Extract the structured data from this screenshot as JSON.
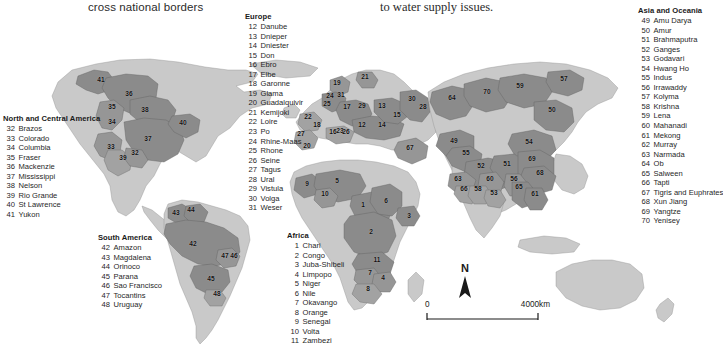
{
  "headings": {
    "left_caption": "cross national borders",
    "right_caption": "to water supply issues."
  },
  "colors": {
    "background": "#ffffff",
    "ocean": "#ffffff",
    "land": "#c9c9c9",
    "basin_dark": "#8b8b8b",
    "basin_mid": "#a4a4a4",
    "coast_line": "#6e6e6e",
    "text": "#1a1a1a"
  },
  "scale": {
    "zero_label": "0",
    "max_label": "4000km",
    "north_label": "N"
  },
  "legends": [
    {
      "id": "europe",
      "title": "Europe",
      "items": [
        {
          "num": "12",
          "name": "Danube"
        },
        {
          "num": "13",
          "name": "Dnieper"
        },
        {
          "num": "14",
          "name": "Dniester"
        },
        {
          "num": "15",
          "name": "Don"
        },
        {
          "num": "16",
          "name": "Ebro"
        },
        {
          "num": "17",
          "name": "Elbe"
        },
        {
          "num": "18",
          "name": "Garonne"
        },
        {
          "num": "19",
          "name": "Glama"
        },
        {
          "num": "20",
          "name": "Guadalquivir"
        },
        {
          "num": "21",
          "name": "Kemijoki"
        },
        {
          "num": "22",
          "name": "Loire"
        },
        {
          "num": "23",
          "name": "Po"
        },
        {
          "num": "24",
          "name": "Rhine-Maas"
        },
        {
          "num": "25",
          "name": "Rhone"
        },
        {
          "num": "26",
          "name": "Seine"
        },
        {
          "num": "27",
          "name": "Tagus"
        },
        {
          "num": "28",
          "name": "Ural"
        },
        {
          "num": "29",
          "name": "Vistula"
        },
        {
          "num": "30",
          "name": "Volga"
        },
        {
          "num": "31",
          "name": "Weser"
        }
      ]
    },
    {
      "id": "asia",
      "title": "Asia and Oceania",
      "items": [
        {
          "num": "49",
          "name": "Amu Darya"
        },
        {
          "num": "50",
          "name": "Amur"
        },
        {
          "num": "51",
          "name": "Brahmaputra"
        },
        {
          "num": "52",
          "name": "Ganges"
        },
        {
          "num": "53",
          "name": "Godavari"
        },
        {
          "num": "54",
          "name": "Hwang Ho"
        },
        {
          "num": "55",
          "name": "Indus"
        },
        {
          "num": "56",
          "name": "Irrawaddy"
        },
        {
          "num": "57",
          "name": "Kolyma"
        },
        {
          "num": "58",
          "name": "Krishna"
        },
        {
          "num": "59",
          "name": "Lena"
        },
        {
          "num": "60",
          "name": "Mahanadi"
        },
        {
          "num": "61",
          "name": "Mekong"
        },
        {
          "num": "62",
          "name": "Murray"
        },
        {
          "num": "63",
          "name": "Narmada"
        },
        {
          "num": "64",
          "name": "Ob"
        },
        {
          "num": "65",
          "name": "Salween"
        },
        {
          "num": "66",
          "name": "Tapti"
        },
        {
          "num": "67",
          "name": "Tigris and Euphrates"
        },
        {
          "num": "68",
          "name": "Xun Jiang"
        },
        {
          "num": "69",
          "name": "Yangtze"
        },
        {
          "num": "70",
          "name": "Yenisey"
        }
      ]
    },
    {
      "id": "namerica",
      "title": "North and Central America",
      "items": [
        {
          "num": "32",
          "name": "Brazos"
        },
        {
          "num": "33",
          "name": "Colorado"
        },
        {
          "num": "34",
          "name": "Columbia"
        },
        {
          "num": "35",
          "name": "Fraser"
        },
        {
          "num": "36",
          "name": "Mackenzie"
        },
        {
          "num": "37",
          "name": "Mississippi"
        },
        {
          "num": "38",
          "name": "Nelson"
        },
        {
          "num": "39",
          "name": "Rio Grande"
        },
        {
          "num": "40",
          "name": "St Lawrence"
        },
        {
          "num": "41",
          "name": "Yukon"
        }
      ]
    },
    {
      "id": "samerica",
      "title": "South America",
      "items": [
        {
          "num": "42",
          "name": "Amazon"
        },
        {
          "num": "43",
          "name": "Magdalena"
        },
        {
          "num": "44",
          "name": "Orinoco"
        },
        {
          "num": "45",
          "name": "Parana"
        },
        {
          "num": "46",
          "name": "Sao Francisco"
        },
        {
          "num": "47",
          "name": "Tocantins"
        },
        {
          "num": "48",
          "name": "Uruguay"
        }
      ]
    },
    {
      "id": "africa",
      "title": "Africa",
      "items": [
        {
          "num": "1",
          "name": "Chari"
        },
        {
          "num": "2",
          "name": "Congo"
        },
        {
          "num": "3",
          "name": "Juba-Shibeli"
        },
        {
          "num": "4",
          "name": "Limpopo"
        },
        {
          "num": "5",
          "name": "Niger"
        },
        {
          "num": "6",
          "name": "Nile"
        },
        {
          "num": "7",
          "name": "Okavango"
        },
        {
          "num": "8",
          "name": "Orange"
        },
        {
          "num": "9",
          "name": "Senegal"
        },
        {
          "num": "10",
          "name": "Volta"
        },
        {
          "num": "11",
          "name": "Zambezi"
        }
      ]
    }
  ],
  "map_labels": [
    {
      "num": "41",
      "x": 101,
      "y": 79
    },
    {
      "num": "36",
      "x": 129,
      "y": 93
    },
    {
      "num": "35",
      "x": 112,
      "y": 106
    },
    {
      "num": "38",
      "x": 145,
      "y": 109
    },
    {
      "num": "34",
      "x": 112,
      "y": 121
    },
    {
      "num": "40",
      "x": 183,
      "y": 122
    },
    {
      "num": "37",
      "x": 148,
      "y": 138
    },
    {
      "num": "33",
      "x": 111,
      "y": 146
    },
    {
      "num": "32",
      "x": 135,
      "y": 152
    },
    {
      "num": "39",
      "x": 123,
      "y": 157
    },
    {
      "num": "43",
      "x": 176,
      "y": 212
    },
    {
      "num": "44",
      "x": 191,
      "y": 209
    },
    {
      "num": "42",
      "x": 193,
      "y": 243
    },
    {
      "num": "47",
      "x": 225,
      "y": 255
    },
    {
      "num": "46",
      "x": 234,
      "y": 255
    },
    {
      "num": "45",
      "x": 211,
      "y": 278
    },
    {
      "num": "48",
      "x": 217,
      "y": 293
    },
    {
      "num": "19",
      "x": 337,
      "y": 82
    },
    {
      "num": "21",
      "x": 365,
      "y": 76
    },
    {
      "num": "24",
      "x": 330,
      "y": 95
    },
    {
      "num": "31",
      "x": 341,
      "y": 94
    },
    {
      "num": "25",
      "x": 327,
      "y": 103
    },
    {
      "num": "17",
      "x": 347,
      "y": 106
    },
    {
      "num": "29",
      "x": 362,
      "y": 105
    },
    {
      "num": "13",
      "x": 382,
      "y": 105
    },
    {
      "num": "30",
      "x": 412,
      "y": 98
    },
    {
      "num": "28",
      "x": 423,
      "y": 106
    },
    {
      "num": "15",
      "x": 397,
      "y": 114
    },
    {
      "num": "22",
      "x": 308,
      "y": 116
    },
    {
      "num": "18",
      "x": 317,
      "y": 124
    },
    {
      "num": "12",
      "x": 362,
      "y": 124
    },
    {
      "num": "14",
      "x": 382,
      "y": 124
    },
    {
      "num": "16",
      "x": 333,
      "y": 131
    },
    {
      "num": "23",
      "x": 340,
      "y": 130
    },
    {
      "num": "26",
      "x": 346,
      "y": 131
    },
    {
      "num": "27",
      "x": 301,
      "y": 133
    },
    {
      "num": "20",
      "x": 307,
      "y": 145
    },
    {
      "num": "67",
      "x": 410,
      "y": 147
    },
    {
      "num": "9",
      "x": 307,
      "y": 183
    },
    {
      "num": "5",
      "x": 337,
      "y": 180
    },
    {
      "num": "10",
      "x": 325,
      "y": 193
    },
    {
      "num": "1",
      "x": 363,
      "y": 204
    },
    {
      "num": "6",
      "x": 386,
      "y": 200
    },
    {
      "num": "3",
      "x": 409,
      "y": 215
    },
    {
      "num": "2",
      "x": 371,
      "y": 231
    },
    {
      "num": "11",
      "x": 377,
      "y": 259
    },
    {
      "num": "7",
      "x": 370,
      "y": 272
    },
    {
      "num": "4",
      "x": 383,
      "y": 277
    },
    {
      "num": "8",
      "x": 368,
      "y": 288
    },
    {
      "num": "57",
      "x": 564,
      "y": 78
    },
    {
      "num": "59",
      "x": 520,
      "y": 85
    },
    {
      "num": "70",
      "x": 487,
      "y": 91
    },
    {
      "num": "64",
      "x": 452,
      "y": 97
    },
    {
      "num": "50",
      "x": 552,
      "y": 109
    },
    {
      "num": "49",
      "x": 454,
      "y": 140
    },
    {
      "num": "55",
      "x": 466,
      "y": 152
    },
    {
      "num": "54",
      "x": 529,
      "y": 141
    },
    {
      "num": "52",
      "x": 481,
      "y": 165
    },
    {
      "num": "51",
      "x": 507,
      "y": 163
    },
    {
      "num": "69",
      "x": 532,
      "y": 158
    },
    {
      "num": "68",
      "x": 540,
      "y": 172
    },
    {
      "num": "63",
      "x": 458,
      "y": 178
    },
    {
      "num": "60",
      "x": 490,
      "y": 178
    },
    {
      "num": "56",
      "x": 514,
      "y": 178
    },
    {
      "num": "66",
      "x": 464,
      "y": 188
    },
    {
      "num": "58",
      "x": 478,
      "y": 188
    },
    {
      "num": "65",
      "x": 519,
      "y": 186
    },
    {
      "num": "53",
      "x": 494,
      "y": 192
    },
    {
      "num": "61",
      "x": 535,
      "y": 193
    }
  ]
}
